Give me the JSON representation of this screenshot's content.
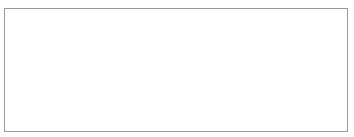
{
  "chart_data": {
    "type": "bar",
    "title": "",
    "xlabel": "",
    "ylabel": "% of GDP",
    "categories": [
      "2005",
      "2006",
      "2007",
      "2008",
      "2009",
      "2010",
      "2011",
      "2012",
      "2013",
      "2014",
      "2015"
    ],
    "ylim": [
      -10,
      0
    ],
    "yticks": [
      0,
      -2,
      -4,
      -6,
      -8,
      -10
    ],
    "ytick_labels": [
      "0%",
      "-2%",
      "-4%",
      "-6%",
      "-8%",
      "-10%"
    ],
    "grid": true,
    "legend_position": "bottom",
    "series": [
      {
        "name": "Savings-Investment",
        "type": "bar",
        "color": "#6e6e6e",
        "values": [
          -1.2,
          -2.4,
          -2.5,
          -3.5,
          -2.9,
          -2.8,
          -1.9,
          -3.8,
          -4.3,
          -4.6,
          -4.4
        ]
      },
      {
        "name": "Current Account Deficit",
        "type": "line",
        "color": "#111111",
        "values": [
          -1.2,
          -2.4,
          -2.5,
          -3.5,
          -2.9,
          -2.8,
          -1.9,
          -3.8,
          -4.3,
          -4.6,
          -4.4
        ]
      }
    ]
  },
  "legend": {
    "savings_label": "Savings-Investment",
    "deficit_label": "Current Account Deficit"
  },
  "axis": {
    "y_title": "% of GDP"
  }
}
